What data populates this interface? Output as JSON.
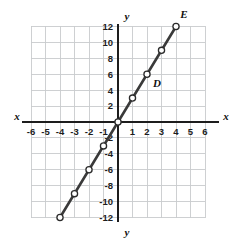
{
  "figure": {
    "background_color": "#ffffff"
  },
  "colors": {
    "grid": "#c9cbcd",
    "grid_border": "#c9cbcd",
    "axis": "#1d1d1d",
    "line": "#3a3a3a",
    "marker_fill": "#ffffff",
    "marker_stroke": "#2b2b2b",
    "text": "#111111"
  },
  "axes": {
    "x_label_left": "x",
    "x_label_right": "x",
    "y_label_top": "y",
    "y_label_bottom": "y",
    "x_ticks": [
      "-6",
      "-5",
      "-4",
      "-3",
      "-2",
      "-1",
      "1",
      "2",
      "3",
      "4",
      "5",
      "6"
    ],
    "y_ticks": [
      "12",
      "10",
      "8",
      "6",
      "4",
      "2",
      "-2",
      "-4",
      "-6",
      "-8",
      "-10",
      "-12"
    ],
    "x_range": [
      -6,
      6
    ],
    "y_range": [
      -12,
      12
    ],
    "x_tick_step": 1,
    "y_tick_step": 2,
    "grid": "on"
  },
  "annotations": [
    {
      "text": "D",
      "x": 2,
      "y": 6,
      "dx": 10,
      "dy": 13
    },
    {
      "text": "E",
      "x": 4,
      "y": 12,
      "dx": 8,
      "dy": -8
    }
  ],
  "chart_data": {
    "type": "line",
    "title": "",
    "xlabel": "x",
    "ylabel": "y",
    "xlim": [
      -6,
      6
    ],
    "ylim": [
      -12,
      12
    ],
    "grid": true,
    "legend": "none",
    "series": [
      {
        "name": "line through D and E",
        "equation": "y = 3x",
        "slope": 3,
        "intercept": 0,
        "marker": "open-circle",
        "x": [
          -4,
          -3,
          -2,
          -1,
          0,
          1,
          2,
          3,
          4
        ],
        "y": [
          -12,
          -9,
          -6,
          -3,
          0,
          3,
          6,
          9,
          12
        ],
        "points": [
          {
            "x": -4,
            "y": -12
          },
          {
            "x": -3,
            "y": -9
          },
          {
            "x": -2,
            "y": -6
          },
          {
            "x": -1,
            "y": -3
          },
          {
            "x": 0,
            "y": 0
          },
          {
            "x": 1,
            "y": 3
          },
          {
            "x": 2,
            "y": 6,
            "label": "D"
          },
          {
            "x": 3,
            "y": 9
          },
          {
            "x": 4,
            "y": 12,
            "label": "E"
          }
        ]
      }
    ]
  }
}
